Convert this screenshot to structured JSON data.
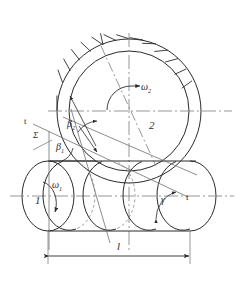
{
  "figure": {
    "background_color": "#ffffff",
    "line_color": "#2b2b2b",
    "centerline_color": "#8a8a8a",
    "thin_line_color": "#6e6e6e"
  },
  "labels": {
    "gear_number": "2",
    "worm_number": "1",
    "omega_gear": "ω",
    "omega_gear_sub": "2",
    "omega_worm": "ω",
    "omega_worm_sub": "1",
    "beta_gear": "β",
    "beta_gear_sub": "2",
    "beta_worm": "β",
    "beta_worm_sub": "1",
    "shaft_angle": "Σ",
    "lead_angle": "γ",
    "tangent_upper": "t",
    "tangent_lower": "t",
    "length_dim": "l"
  },
  "geometry": {
    "gear": {
      "center_x": 129,
      "center_y": 111,
      "outer_radius": 72,
      "pitch_radius": 60,
      "tooth_count": 13
    },
    "worm": {
      "axis_y": 196,
      "left_end_x": 48,
      "right_end_x": 190,
      "ellipse_rx": 26,
      "ellipse_ry": 35
    },
    "dimension": {
      "y": 256,
      "x_start": 48,
      "x_end": 190
    }
  },
  "annotations": {
    "gear_axis_label": "vertical axis of gear 2",
    "worm_axis_label": "horizontal axis of worm 1",
    "helix_label": "helix / tooth-trace direction"
  }
}
